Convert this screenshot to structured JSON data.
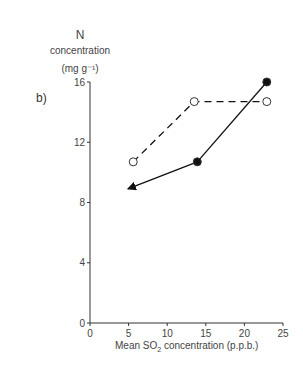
{
  "panel_label": "b)",
  "chart_data": {
    "type": "line",
    "title": "",
    "ylabel_lines": [
      "N",
      "concentration",
      "(mg g⁻¹)"
    ],
    "xlabel": "Mean SO2 concentration (p.p.b.)",
    "xlabel_parts": {
      "pre": "Mean SO",
      "sub": "2",
      "post": " concentration (p.p.b.)"
    },
    "xlim": [
      0,
      25
    ],
    "ylim": [
      0,
      16
    ],
    "xticks": [
      0,
      5,
      10,
      15,
      20,
      25
    ],
    "yticks": [
      0,
      4,
      8,
      12,
      16
    ],
    "grid": false,
    "legend": null,
    "series": [
      {
        "name": "open circles (dashed)",
        "marker": "open-circle",
        "line": "dashed",
        "points": [
          [
            5.6,
            10.7
          ],
          [
            13.5,
            14.7
          ],
          [
            22.9,
            14.7
          ]
        ]
      },
      {
        "name": "filled circles (solid, arrow)",
        "marker": "filled-circle",
        "line": "solid",
        "points": [
          [
            22.9,
            16.0
          ],
          [
            13.9,
            10.7
          ]
        ],
        "arrow_to": [
          4.9,
          8.9
        ]
      }
    ]
  }
}
